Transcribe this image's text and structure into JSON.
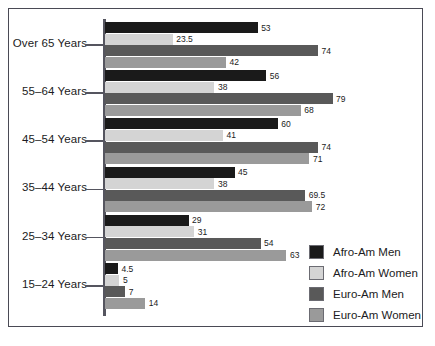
{
  "chart_data": {
    "type": "bar",
    "orientation": "horizontal",
    "title": "",
    "xlabel": "",
    "ylabel": "",
    "grid": false,
    "legend_position": "bottom-right",
    "xlim": [
      0,
      79
    ],
    "categories": [
      "Over 65 Years",
      "55–64 Years",
      "45–54 Years",
      "35–44 Years",
      "25–34 Years",
      "15–24 Years"
    ],
    "series": [
      {
        "name": "Afro-Am Men",
        "color": "#1a1a1a",
        "values": [
          53,
          56,
          60,
          45,
          29,
          4.5
        ],
        "labels": [
          "53",
          "56",
          "60",
          "45",
          "29",
          "4.5"
        ]
      },
      {
        "name": "Afro-Am Women",
        "color": "#d4d4d4",
        "values": [
          23.5,
          38,
          41,
          38,
          31,
          5
        ],
        "labels": [
          "23.5",
          "38",
          "41",
          "38",
          "31",
          "5"
        ]
      },
      {
        "name": "Euro-Am Men",
        "color": "#595959",
        "values": [
          74,
          79,
          74,
          69.5,
          54,
          7
        ],
        "labels": [
          "74",
          "79",
          "74",
          "69.5",
          "54",
          "7"
        ]
      },
      {
        "name": "Euro-Am Women",
        "color": "#9a9a9a",
        "values": [
          42,
          68,
          71,
          72,
          63,
          14
        ],
        "labels": [
          "42",
          "68",
          "71",
          "72",
          "63",
          "14"
        ]
      }
    ]
  },
  "legend": {
    "items": [
      {
        "label": "Afro-Am Men",
        "color": "#1a1a1a"
      },
      {
        "label": "Afro-Am Women",
        "color": "#d4d4d4"
      },
      {
        "label": "Euro-Am Men",
        "color": "#595959"
      },
      {
        "label": "Euro-Am Women",
        "color": "#9a9a9a"
      }
    ]
  },
  "axis": {
    "labels": [
      "Over 65 Years",
      "55–64 Years",
      "45–54 Years",
      "35–44 Years",
      "25–34 Years",
      "15–24 Years"
    ]
  }
}
